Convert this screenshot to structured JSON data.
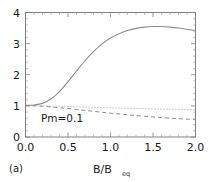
{
  "panel": {
    "label": "(a)"
  },
  "annotation": {
    "text": "Pm=0.1"
  },
  "axes": {
    "x_title_main": "B/B",
    "x_title_sub": "eq",
    "x_ticklabels": [
      "0.0",
      "0.5",
      "1.0",
      "1.5",
      "2.0"
    ],
    "y_ticklabels": [
      "0",
      "1",
      "2",
      "3",
      "4"
    ]
  },
  "colors": {
    "background": "#ffffff",
    "frame": "#808080",
    "solid_curve": "#8c8c8c",
    "dotted_curve": "#9e9e9e",
    "dashed_curve": "#8c8c8c",
    "text": "#1a1a1a"
  },
  "chart_data": {
    "type": "line",
    "title": "",
    "subtitle": "",
    "xlabel": "B/B_eq",
    "ylabel": "",
    "xlim": [
      0.0,
      2.0
    ],
    "ylim": [
      0,
      4
    ],
    "xticks": [
      0.0,
      0.5,
      1.0,
      1.5,
      2.0
    ],
    "yticks": [
      0,
      1,
      2,
      3,
      4
    ],
    "grid": false,
    "legend": null,
    "legend_position": "none",
    "annotations": [
      {
        "text": "Pm=0.1",
        "x": 0.33,
        "y": 0.62
      },
      {
        "text": "(a)",
        "x": -0.12,
        "y": -0.62
      }
    ],
    "x": [
      0.0,
      0.1,
      0.2,
      0.3,
      0.4,
      0.5,
      0.6,
      0.7,
      0.8,
      0.9,
      1.0,
      1.1,
      1.2,
      1.3,
      1.4,
      1.5,
      1.6,
      1.7,
      1.8,
      1.9,
      2.0
    ],
    "series": [
      {
        "name": "solid",
        "style": "solid",
        "values": [
          1.02,
          1.03,
          1.08,
          1.22,
          1.46,
          1.78,
          2.12,
          2.45,
          2.74,
          2.99,
          3.18,
          3.32,
          3.42,
          3.49,
          3.53,
          3.55,
          3.55,
          3.53,
          3.5,
          3.46,
          3.42
        ]
      },
      {
        "name": "dotted",
        "style": "dotted",
        "values": [
          1.01,
          1.01,
          1.0,
          0.995,
          0.99,
          0.98,
          0.97,
          0.96,
          0.955,
          0.945,
          0.935,
          0.93,
          0.92,
          0.915,
          0.91,
          0.9,
          0.895,
          0.89,
          0.885,
          0.88,
          0.875
        ]
      },
      {
        "name": "dashed",
        "style": "dashed",
        "values": [
          1.01,
          1.0,
          0.985,
          0.965,
          0.94,
          0.915,
          0.885,
          0.855,
          0.825,
          0.795,
          0.765,
          0.74,
          0.715,
          0.69,
          0.665,
          0.645,
          0.625,
          0.605,
          0.59,
          0.575,
          0.56
        ]
      }
    ]
  }
}
